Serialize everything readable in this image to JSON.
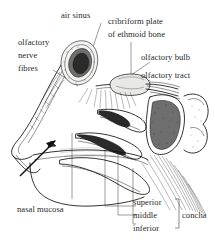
{
  "figure": {
    "background_color": "#ffffff",
    "ink_color": "#111111",
    "label_color": "#2a2a2a"
  },
  "labels": {
    "air_sinus": "air sinus",
    "olfactory_nerve_fibres_l1": "olfactory",
    "olfactory_nerve_fibres_l2": "nerve",
    "olfactory_nerve_fibres_l3": "fibres",
    "cribriform_plate_l1": "cribriform plate",
    "cribriform_plate_l2": "of ethmoid bone",
    "olfactory_bulb": "olfactory bulb",
    "olfactory_tract": "olfactory tract",
    "nasal_mucosa": "nasal mucosa",
    "concha_superior": "superior",
    "concha_middle": "middle",
    "concha_inferior": "inferior",
    "concha_group": "concha"
  },
  "structures": [
    {
      "name": "frontal-air-sinus",
      "label": "air sinus",
      "shading": "dark-stippled"
    },
    {
      "name": "olfactory-bulb",
      "label": "olfactory bulb",
      "shading": "pale"
    },
    {
      "name": "olfactory-tract",
      "label": "olfactory tract",
      "shading": "line"
    },
    {
      "name": "olfactory-nerve-fibres",
      "label": "olfactory nerve fibres",
      "shading": "hairlines"
    },
    {
      "name": "cribriform-plate-of-ethmoid-bone",
      "label": "cribriform plate of ethmoid bone",
      "shading": "line"
    },
    {
      "name": "sphenoid-sinus",
      "label": "air sinus",
      "shading": "dark-stippled"
    },
    {
      "name": "superior-concha",
      "label": "superior",
      "shading": "dark-tip"
    },
    {
      "name": "middle-concha",
      "label": "middle",
      "shading": "dark-tip"
    },
    {
      "name": "inferior-concha",
      "label": "inferior",
      "shading": "dark-tip"
    },
    {
      "name": "nasal-mucosa",
      "label": "nasal mucosa",
      "shading": "line"
    },
    {
      "name": "airflow-arrow",
      "label": "",
      "shading": "solid"
    }
  ]
}
